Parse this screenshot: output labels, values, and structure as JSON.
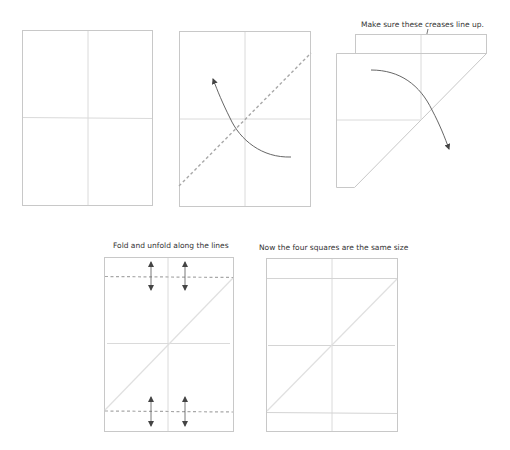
{
  "diagram": {
    "colors": {
      "paper_edge": "#c8c8c8",
      "crease": "#d8d8d8",
      "diagonal_crease": "#e0e0e0",
      "dashed_fold": "#a8a8a8",
      "arrow": "#555555",
      "text": "#333333"
    },
    "steps": [
      {
        "id": 1,
        "description": "Sheet with vertical and horizontal center creases",
        "caption": ""
      },
      {
        "id": 2,
        "description": "Valley fold along the diagonal, bottom-right corner up to top-left",
        "caption": ""
      },
      {
        "id": 3,
        "description": "Folded sheet with top strip showing",
        "caption": "Make sure these creases line up."
      },
      {
        "id": 4,
        "description": "Fold strips at top and bottom, then unfold",
        "caption": "Fold and unfold along the lines"
      },
      {
        "id": 5,
        "description": "Result with four equal squares",
        "caption": "Now the four squares are the same size"
      }
    ]
  }
}
